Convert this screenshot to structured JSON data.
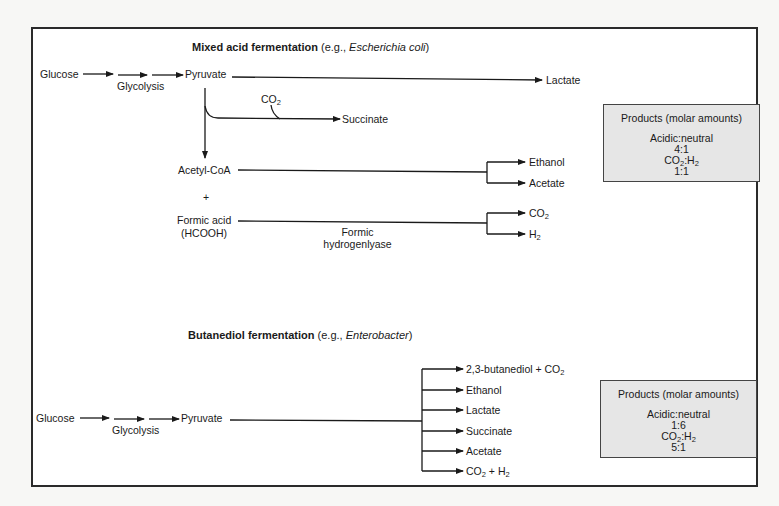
{
  "mixed_acid": {
    "title_bold": "Mixed acid fermentation",
    "title_paren_open": "(e.g., ",
    "title_organism": "Escherichia coli",
    "title_paren_close": ")",
    "glucose": "Glucose",
    "glycolysis": "Glycolysis",
    "pyruvate": "Pyruvate",
    "lactate": "Lactate",
    "co2_label": "CO",
    "co2_sub": "2",
    "succinate": "Succinate",
    "acetyl_coa": "Acetyl-CoA",
    "plus": "+",
    "formic_acid": "Formic acid",
    "hcooh": "(HCOOH)",
    "enzyme_line1": "Formic",
    "enzyme_line2": "hydrogenlyase",
    "ethanol": "Ethanol",
    "acetate": "Acetate",
    "product_co2": "CO",
    "product_co2_sub": "2",
    "product_h2": "H",
    "product_h2_sub": "2",
    "products_box": {
      "heading": "Products (molar amounts)",
      "ratio1_label": "Acidic:neutral",
      "ratio1_value": "4:1",
      "ratio2_label_a": "CO",
      "ratio2_sub_a": "2",
      "ratio2_label_b": ":H",
      "ratio2_sub_b": "2",
      "ratio2_value": "1:1"
    }
  },
  "butanediol": {
    "title_bold": "Butanediol fermentation",
    "title_paren_open": "(e.g., ",
    "title_organism": "Enterobacter",
    "title_paren_close": ")",
    "glucose": "Glucose",
    "glycolysis": "Glycolysis",
    "pyruvate": "Pyruvate",
    "products": [
      {
        "text": "2,3-butanediol + CO",
        "sub": "2",
        "tail": ""
      },
      {
        "text": "Ethanol",
        "sub": "",
        "tail": ""
      },
      {
        "text": "Lactate",
        "sub": "",
        "tail": ""
      },
      {
        "text": "Succinate",
        "sub": "",
        "tail": ""
      },
      {
        "text": "Acetate",
        "sub": "",
        "tail": ""
      },
      {
        "text": "CO",
        "sub": "2",
        "tail": " + H",
        "sub2": "2"
      }
    ],
    "products_box": {
      "heading": "Products (molar amounts)",
      "ratio1_label": "Acidic:neutral",
      "ratio1_value": "1:6",
      "ratio2_label_a": "CO",
      "ratio2_sub_a": "2",
      "ratio2_label_b": ":H",
      "ratio2_sub_b": "2",
      "ratio2_value": "5:1"
    }
  },
  "colors": {
    "frame": "#2a2a2a",
    "product_box_fill": "#e6e6e6",
    "line": "#1a1a1a"
  }
}
